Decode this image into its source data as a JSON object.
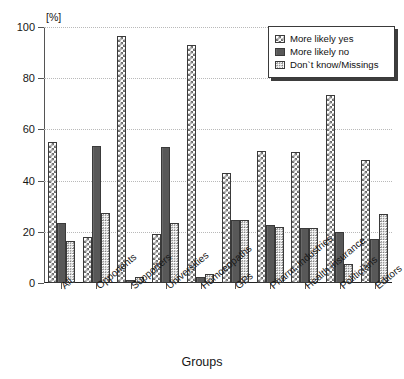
{
  "chart_data": {
    "type": "bar",
    "title": "",
    "xlabel": "Groups",
    "ylabel": "",
    "unit_label": "[%]",
    "ylim": [
      0,
      100
    ],
    "yticks": [
      0,
      20,
      40,
      60,
      80,
      100
    ],
    "grid": true,
    "legend_position": "top-right",
    "categories": [
      "All",
      "Opponents",
      "Supporters",
      "Universities",
      "Homoeopaths",
      "GPs",
      "Pharm. industries",
      "Health insurance",
      "Politicians",
      "Editors"
    ],
    "series": [
      {
        "name": "More likely yes",
        "pattern": "checkerboard",
        "values": [
          55,
          18,
          96.5,
          19,
          93,
          43,
          51.5,
          51,
          73.5,
          48
        ]
      },
      {
        "name": "More likely no",
        "pattern": "solid-dark",
        "values": [
          23.5,
          53.5,
          1,
          53,
          2.5,
          24.5,
          22.5,
          21.5,
          20,
          17
        ]
      },
      {
        "name": "Don`t know/Missings",
        "pattern": "fine-dots",
        "values": [
          16.5,
          27.5,
          2.5,
          23.5,
          3.5,
          24.5,
          22,
          21.5,
          7.5,
          27
        ]
      }
    ]
  },
  "legend": {
    "items": [
      {
        "label": "More likely yes"
      },
      {
        "label": "More likely no"
      },
      {
        "label": "Don`t know/Missings"
      }
    ]
  },
  "colors": {
    "series_yes": "#6e6e6e",
    "series_no": "#585858",
    "series_dontknow": "#7a7a7a",
    "axis": "#222222",
    "grid": "#b9b9b9",
    "background": "#ffffff"
  }
}
